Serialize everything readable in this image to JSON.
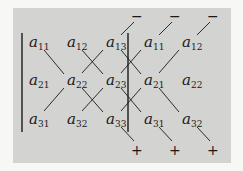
{
  "diagram": {
    "matrix": [
      [
        "a11",
        "a12",
        "a13"
      ],
      [
        "a21",
        "a22",
        "a23"
      ],
      [
        "a31",
        "a32",
        "a33"
      ]
    ],
    "repeated_columns": [
      [
        "a11",
        "a12"
      ],
      [
        "a21",
        "a22"
      ],
      [
        "a31",
        "a32"
      ]
    ],
    "entries": [
      {
        "id": "e11",
        "base": "a",
        "sub": "11",
        "x": 29,
        "y": 47
      },
      {
        "id": "e12",
        "base": "a",
        "sub": "12",
        "x": 67,
        "y": 47
      },
      {
        "id": "e13",
        "base": "a",
        "sub": "13",
        "x": 106,
        "y": 47
      },
      {
        "id": "e11r",
        "base": "a",
        "sub": "11",
        "x": 144,
        "y": 47
      },
      {
        "id": "e12r",
        "base": "a",
        "sub": "12",
        "x": 182,
        "y": 47
      },
      {
        "id": "e21",
        "base": "a",
        "sub": "21",
        "x": 29,
        "y": 85
      },
      {
        "id": "e22",
        "base": "a",
        "sub": "22",
        "x": 67,
        "y": 85
      },
      {
        "id": "e23",
        "base": "a",
        "sub": "23",
        "x": 106,
        "y": 85
      },
      {
        "id": "e21r",
        "base": "a",
        "sub": "21",
        "x": 144,
        "y": 85
      },
      {
        "id": "e22r",
        "base": "a",
        "sub": "22",
        "x": 182,
        "y": 85
      },
      {
        "id": "e31",
        "base": "a",
        "sub": "31",
        "x": 29,
        "y": 124
      },
      {
        "id": "e32",
        "base": "a",
        "sub": "32",
        "x": 67,
        "y": 124
      },
      {
        "id": "e33",
        "base": "a",
        "sub": "33",
        "x": 106,
        "y": 124
      },
      {
        "id": "e31r",
        "base": "a",
        "sub": "31",
        "x": 144,
        "y": 124
      },
      {
        "id": "e32r",
        "base": "a",
        "sub": "32",
        "x": 182,
        "y": 124
      }
    ],
    "minus_signs": [
      "−",
      "−",
      "−"
    ],
    "plus_signs": [
      "+",
      "+",
      "+"
    ],
    "colors": {
      "panel": "#d3d3d1",
      "ink": "#1a1a1a",
      "background": "#f7f7f5"
    }
  }
}
